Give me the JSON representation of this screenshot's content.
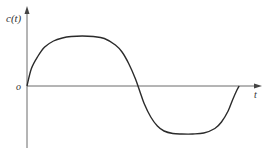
{
  "chart_data": {
    "type": "line",
    "title": "",
    "xlabel": "t",
    "ylabel": "c(t)",
    "origin_label": "o",
    "grid": false,
    "legend": "none",
    "xlim": [
      0,
      1.1
    ],
    "ylim": [
      -1.1,
      1.05
    ],
    "series": [
      {
        "name": "c(t)",
        "x": [
          0,
          0.02,
          0.05,
          0.08,
          0.12,
          0.16,
          0.2,
          0.25,
          0.3,
          0.35,
          0.4,
          0.43,
          0.46,
          0.49,
          0.51,
          0.53,
          0.56,
          0.59,
          0.62,
          0.66,
          0.7,
          0.75,
          0.8,
          0.85,
          0.88,
          0.91,
          0.93,
          0.95,
          0.96
        ],
        "values": [
          0,
          0.35,
          0.6,
          0.78,
          0.9,
          0.96,
          0.99,
          1.0,
          0.99,
          0.95,
          0.82,
          0.68,
          0.45,
          0.15,
          -0.1,
          -0.35,
          -0.62,
          -0.8,
          -0.9,
          -0.95,
          -0.96,
          -0.96,
          -0.94,
          -0.85,
          -0.72,
          -0.5,
          -0.28,
          -0.08,
          0
        ],
        "color": "#2b2b2b"
      }
    ]
  }
}
